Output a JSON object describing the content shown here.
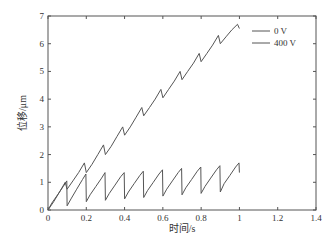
{
  "chart_data": {
    "type": "line",
    "title": "",
    "xlabel": "时间/s",
    "ylabel": "位移/μm",
    "xlim": [
      0,
      1.4
    ],
    "ylim": [
      0,
      7
    ],
    "xticks": [
      "0",
      "0.2",
      "0.4",
      "0.6",
      "0.8",
      "1",
      "1.2",
      "1.4"
    ],
    "xtick_values": [
      0,
      0.2,
      0.4,
      0.6,
      0.8,
      1.0,
      1.2,
      1.4
    ],
    "yticks": [
      "0",
      "1",
      "2",
      "3",
      "4",
      "5",
      "6",
      "7"
    ],
    "ytick_values": [
      0,
      1,
      2,
      3,
      4,
      5,
      6,
      7
    ],
    "grid": false,
    "legend_position": "upper right",
    "series": [
      {
        "name": "0 V",
        "color": "#555555",
        "x": [
          0.0,
          0.02,
          0.05,
          0.08,
          0.098,
          0.1,
          0.12,
          0.15,
          0.18,
          0.198,
          0.2,
          0.22,
          0.25,
          0.28,
          0.298,
          0.3,
          0.32,
          0.35,
          0.38,
          0.398,
          0.4,
          0.42,
          0.45,
          0.48,
          0.498,
          0.5,
          0.52,
          0.55,
          0.58,
          0.598,
          0.6,
          0.62,
          0.65,
          0.68,
          0.698,
          0.7,
          0.72,
          0.75,
          0.78,
          0.798,
          0.8,
          0.82,
          0.85,
          0.88,
          0.898,
          0.9,
          0.92,
          0.95,
          0.98,
          0.998,
          1.0
        ],
        "values": [
          0.0,
          0.25,
          0.55,
          0.85,
          1.05,
          0.15,
          0.4,
          0.75,
          1.1,
          1.3,
          0.3,
          0.55,
          0.85,
          1.15,
          1.35,
          0.35,
          0.6,
          0.9,
          1.2,
          1.35,
          0.4,
          0.65,
          0.95,
          1.25,
          1.4,
          0.45,
          0.7,
          1.0,
          1.3,
          1.45,
          0.5,
          0.75,
          1.05,
          1.35,
          1.5,
          0.55,
          0.8,
          1.1,
          1.4,
          1.55,
          0.6,
          0.85,
          1.15,
          1.45,
          1.6,
          0.65,
          0.95,
          1.25,
          1.55,
          1.7,
          1.35
        ]
      },
      {
        "name": "400 V",
        "color": "#555555",
        "x": [
          0.0,
          0.03,
          0.06,
          0.09,
          0.1,
          0.13,
          0.16,
          0.19,
          0.2,
          0.23,
          0.26,
          0.29,
          0.3,
          0.33,
          0.36,
          0.39,
          0.4,
          0.43,
          0.46,
          0.49,
          0.5,
          0.53,
          0.56,
          0.59,
          0.6,
          0.63,
          0.66,
          0.69,
          0.7,
          0.73,
          0.76,
          0.79,
          0.8,
          0.83,
          0.86,
          0.89,
          0.9,
          0.93,
          0.96,
          0.99,
          1.0
        ],
        "values": [
          0.0,
          0.3,
          0.65,
          1.0,
          0.75,
          1.05,
          1.35,
          1.7,
          1.35,
          1.65,
          2.0,
          2.35,
          2.0,
          2.3,
          2.65,
          3.0,
          2.7,
          3.0,
          3.35,
          3.7,
          3.4,
          3.7,
          4.0,
          4.35,
          4.05,
          4.35,
          4.65,
          5.0,
          4.7,
          5.0,
          5.3,
          5.65,
          5.35,
          5.65,
          5.95,
          6.3,
          6.0,
          6.25,
          6.5,
          6.7,
          6.55
        ]
      }
    ]
  }
}
